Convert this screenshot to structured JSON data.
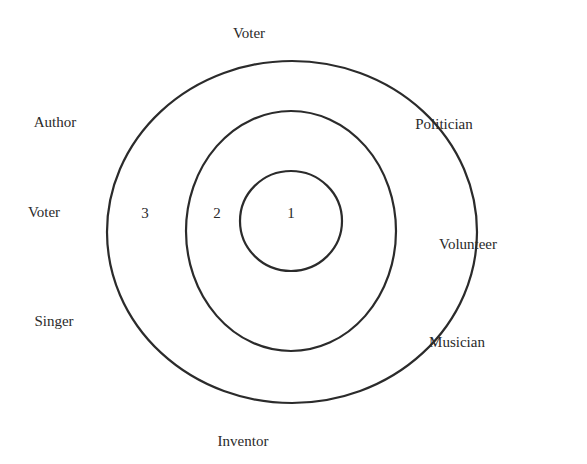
{
  "diagram": {
    "rings": [
      {
        "label": "1",
        "cx": 292,
        "cy": 221,
        "rx": 51,
        "ry": 50
      },
      {
        "label": "2",
        "cx": 292,
        "cy": 232,
        "rx": 105,
        "ry": 120
      },
      {
        "label": "3",
        "cx": 292,
        "cy": 232,
        "rx": 185,
        "ry": 171
      }
    ],
    "ring_labels": {
      "one": "1",
      "two": "2",
      "three": "3"
    },
    "outer_labels": {
      "top": "Voter",
      "upper_left": "Author",
      "left": "Voter",
      "lower_left": "Singer",
      "bottom": "Inventor",
      "upper_right": "Politician",
      "right": "Volunteer",
      "lower_right": "Musician"
    },
    "stroke_color": "#2b2b2b"
  }
}
